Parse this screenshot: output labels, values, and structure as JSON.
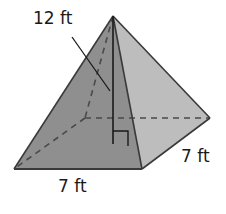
{
  "figure": {
    "type": "square pyramid",
    "labels": {
      "height": "12 ft",
      "base_front": "7 ft",
      "base_side": "7 ft"
    },
    "colors": {
      "front_face": "#8f8f8f",
      "right_face": "#bdbdbd",
      "edge": "#3a3a3a",
      "hidden_edge": "#4a4a4a",
      "height_line": "#1a1a1a"
    },
    "vertices": {
      "apex": [
        113,
        16
      ],
      "front_left": [
        14,
        169
      ],
      "front_right": [
        142,
        169
      ],
      "back_right": [
        210,
        118
      ],
      "back_left": [
        85,
        118
      ]
    },
    "height_foot": [
      113,
      144
    ],
    "right_angle_marker": true
  }
}
